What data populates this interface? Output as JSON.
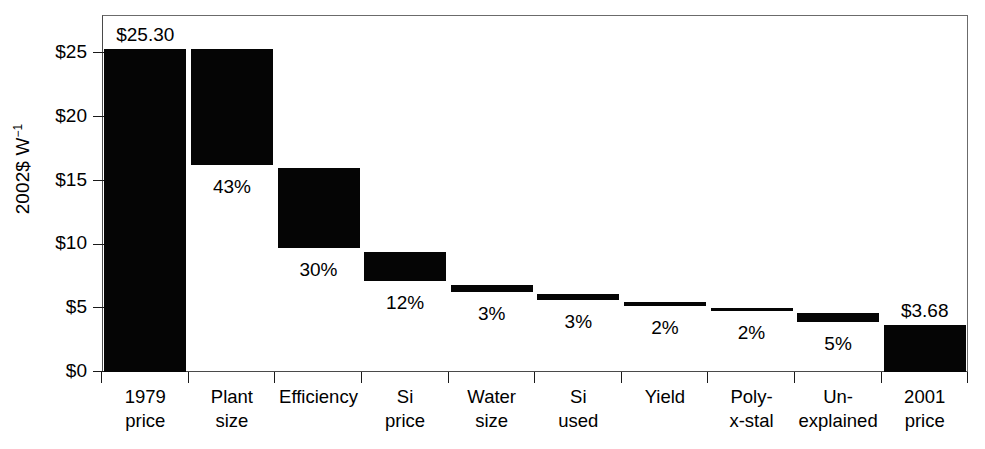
{
  "axis": {
    "y_title": "2002$ W",
    "y_title_exponent": "−1",
    "y_ticks": [
      "$0",
      "$5",
      "$10",
      "$15",
      "$20",
      "$25"
    ]
  },
  "chart_data": {
    "type": "bar",
    "chart_subtype": "waterfall",
    "title": "",
    "xlabel": "",
    "ylabel": "2002$ W⁻¹",
    "ylim": [
      0,
      28
    ],
    "grid": false,
    "legend": false,
    "categories": [
      "1979 price",
      "Plant size",
      "Efficiency",
      "Si price",
      "Water size",
      "Si used",
      "Yield",
      "Poly-x-stal",
      "Un-explained",
      "2001 price"
    ],
    "category_lines": [
      [
        "1979",
        "price"
      ],
      [
        "Plant",
        "size"
      ],
      [
        "Efficiency",
        ""
      ],
      [
        "Si",
        "price"
      ],
      [
        "Water",
        "size"
      ],
      [
        "Si",
        "used"
      ],
      [
        "Yield",
        ""
      ],
      [
        "Poly-",
        "x-stal"
      ],
      [
        "Un-",
        "explained"
      ],
      [
        "2001",
        "price"
      ]
    ],
    "bars": [
      {
        "category": "1979 price",
        "kind": "total",
        "bottom": 0.0,
        "top": 25.3,
        "label": "$25.30",
        "label_pos": "above"
      },
      {
        "category": "Plant size",
        "kind": "decrease",
        "bottom": 16.2,
        "top": 25.3,
        "label": "43%",
        "label_pos": "below"
      },
      {
        "category": "Efficiency",
        "kind": "decrease",
        "bottom": 9.7,
        "top": 16.0,
        "label": "30%",
        "label_pos": "below"
      },
      {
        "category": "Si price",
        "kind": "decrease",
        "bottom": 7.1,
        "top": 9.4,
        "label": "12%",
        "label_pos": "below"
      },
      {
        "category": "Water size",
        "kind": "decrease",
        "bottom": 6.3,
        "top": 6.8,
        "label": "3%",
        "label_pos": "below"
      },
      {
        "category": "Si used",
        "kind": "decrease",
        "bottom": 5.65,
        "top": 6.15,
        "label": "3%",
        "label_pos": "below"
      },
      {
        "category": "Yield",
        "kind": "decrease",
        "bottom": 5.2,
        "top": 5.45,
        "label": "2%",
        "label_pos": "below"
      },
      {
        "category": "Poly-x-stal",
        "kind": "decrease",
        "bottom": 4.8,
        "top": 5.05,
        "label": "2%",
        "label_pos": "below"
      },
      {
        "category": "Un-explained",
        "kind": "decrease",
        "bottom": 3.9,
        "top": 4.6,
        "label": "5%",
        "label_pos": "below"
      },
      {
        "category": "2001 price",
        "kind": "total",
        "bottom": 0.0,
        "top": 3.68,
        "label": "$3.68",
        "label_pos": "above"
      }
    ],
    "bar_color": "#050505",
    "value_labels": [
      "$25.30",
      "43%",
      "30%",
      "12%",
      "3%",
      "3%",
      "2%",
      "2%",
      "5%",
      "$3.68"
    ]
  }
}
